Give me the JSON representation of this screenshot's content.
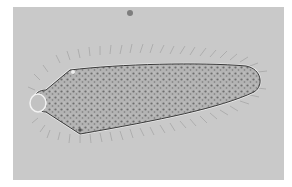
{
  "image": {
    "subject": "ciliate protozoan micrograph",
    "description": "Brightfield micrograph of an elongated, cilia-covered single-celled organism with a granular cytoplasm, a small rounded anterior knob on the left, and a tapered posterior on the right; a small dark particle floats above.",
    "colors": {
      "frame": "#ffffff",
      "background": "#c9c9c9",
      "cell_body": "#b4b4b4",
      "outline": "#3a3a3a",
      "granules": "#6e6e6e",
      "cilia": "#a9a9a9",
      "halo": "#e8e8e8"
    }
  }
}
